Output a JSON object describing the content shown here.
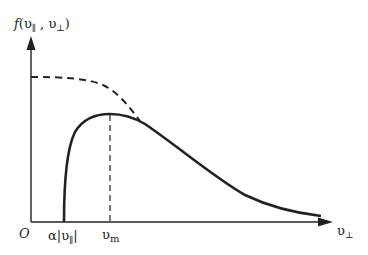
{
  "diagram": {
    "y_axis_label": {
      "f": "f",
      "open": "(",
      "v_par": "υ",
      "sub_par": "∥",
      "comma": " , ",
      "v_perp": "υ",
      "sub_perp": "⊥",
      "close": ")"
    },
    "x_axis_label": {
      "v": "υ",
      "sub": "⊥"
    },
    "origin_label": "O",
    "tick_labels": {
      "alpha_v_par": {
        "alpha": "α",
        "bar_l": "|",
        "v": "υ",
        "sub": "∥",
        "bar_r": "|"
      },
      "v_m": {
        "v": "υ",
        "sub": "m"
      }
    },
    "curves": [
      {
        "name": "maxwellian-dashed",
        "style": "dashed"
      },
      {
        "name": "loss-cone-solid",
        "style": "solid"
      }
    ],
    "colors": {
      "line": "#222222",
      "background": "#ffffff"
    }
  }
}
